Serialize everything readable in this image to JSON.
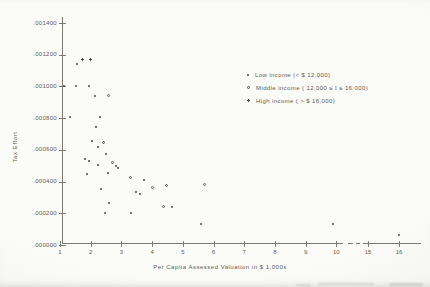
{
  "page": {
    "background": "#f7f7f4",
    "ink_color": "#56564f",
    "axis_color": "#7b7b74"
  },
  "chart_data": {
    "type": "scatter",
    "title": "",
    "xlabel": "Per Capita Assessed Valuation in $ 1,000s",
    "ylabel": "Tax Effort",
    "grid": false,
    "legend_position": "inside upper right",
    "x_ticks": [
      1,
      2,
      3,
      4,
      5,
      6,
      7,
      8,
      9,
      10,
      15,
      16
    ],
    "x_axis_break_between": [
      10,
      15
    ],
    "y_tick_labels": [
      ".001400",
      ".001200",
      ".001000",
      ".000800",
      ".000600",
      ".000400",
      ".000200",
      ".000000"
    ],
    "y_tick_values": [
      0.0014,
      0.0012,
      0.001,
      0.0008,
      0.0006,
      0.0004,
      0.0002,
      0.0
    ],
    "xlim": [
      1,
      16.5
    ],
    "ylim": [
      0.0,
      0.0014
    ],
    "series": [
      {
        "label": "Low  income (< $ 12,000)",
        "marker": "dot"
      },
      {
        "label": "Middle  income ( 12,000 ≤ I ≤ 16,000)",
        "marker": "circle"
      },
      {
        "label": "High income ( > $ 16,000)",
        "marker": "plus"
      }
    ],
    "points": [
      {
        "x": 1.14,
        "y": 0.001,
        "s": 0
      },
      {
        "x": 1.54,
        "y": 0.00114,
        "s": 0
      },
      {
        "x": 1.52,
        "y": 0.001,
        "s": 0
      },
      {
        "x": 1.72,
        "y": 0.00117,
        "s": 2
      },
      {
        "x": 1.99,
        "y": 0.00117,
        "s": 2
      },
      {
        "x": 1.95,
        "y": 0.001,
        "s": 0
      },
      {
        "x": 2.15,
        "y": 0.00094,
        "s": 0
      },
      {
        "x": 2.59,
        "y": 0.00094,
        "s": 1
      },
      {
        "x": 1.32,
        "y": 0.000805,
        "s": 0
      },
      {
        "x": 2.31,
        "y": 0.00081,
        "s": 0
      },
      {
        "x": 2.18,
        "y": 0.000745,
        "s": 0
      },
      {
        "x": 2.04,
        "y": 0.000658,
        "s": 0
      },
      {
        "x": 2.43,
        "y": 0.000648,
        "s": 1
      },
      {
        "x": 2.24,
        "y": 0.000621,
        "s": 0
      },
      {
        "x": 2.51,
        "y": 0.000572,
        "s": 0
      },
      {
        "x": 1.81,
        "y": 0.000543,
        "s": 0
      },
      {
        "x": 1.94,
        "y": 0.00053,
        "s": 0
      },
      {
        "x": 2.22,
        "y": 0.000505,
        "s": 0
      },
      {
        "x": 2.72,
        "y": 0.000521,
        "s": 1
      },
      {
        "x": 2.83,
        "y": 0.0005,
        "s": 0
      },
      {
        "x": 2.88,
        "y": 0.000483,
        "s": 0
      },
      {
        "x": 1.88,
        "y": 0.000446,
        "s": 0
      },
      {
        "x": 2.56,
        "y": 0.000456,
        "s": 0
      },
      {
        "x": 3.31,
        "y": 0.000427,
        "s": 1
      },
      {
        "x": 3.74,
        "y": 0.00041,
        "s": 0
      },
      {
        "x": 2.34,
        "y": 0.000351,
        "s": 0
      },
      {
        "x": 3.47,
        "y": 0.000336,
        "s": 0
      },
      {
        "x": 3.61,
        "y": 0.00032,
        "s": 0
      },
      {
        "x": 4.01,
        "y": 0.000361,
        "s": 1
      },
      {
        "x": 4.47,
        "y": 0.000378,
        "s": 1
      },
      {
        "x": 5.69,
        "y": 0.000383,
        "s": 1
      },
      {
        "x": 2.61,
        "y": 0.000263,
        "s": 0
      },
      {
        "x": 2.47,
        "y": 0.0002,
        "s": 0
      },
      {
        "x": 3.31,
        "y": 0.0002,
        "s": 0
      },
      {
        "x": 4.36,
        "y": 0.000242,
        "s": 1
      },
      {
        "x": 4.66,
        "y": 0.000242,
        "s": 0
      },
      {
        "x": 5.6,
        "y": 0.000132,
        "s": 0
      },
      {
        "x": 9.9,
        "y": 0.000132,
        "s": 0
      },
      {
        "x": 16.0,
        "y": 6.3e-05,
        "s": 0
      }
    ]
  }
}
